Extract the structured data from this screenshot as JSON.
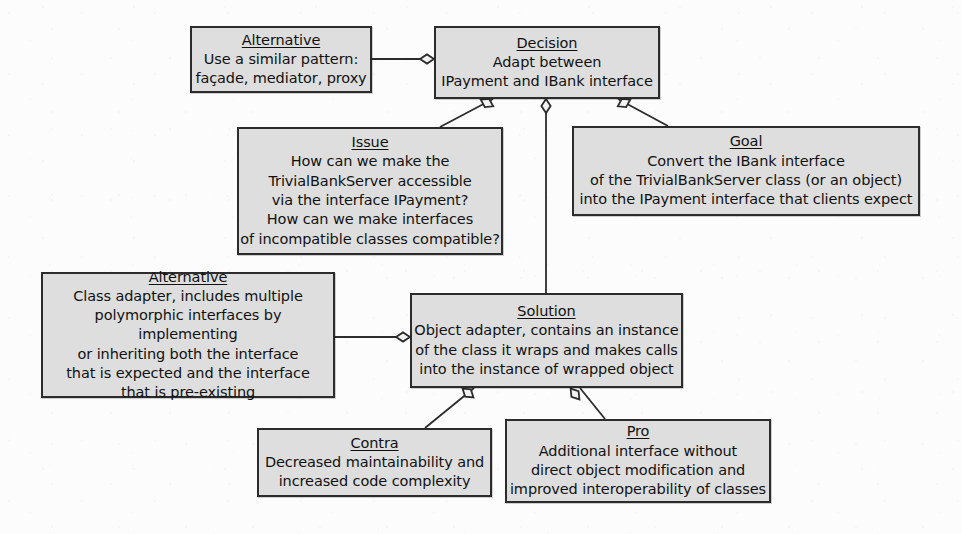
{
  "diagram": {
    "kind": "design-rationale-qoc-diagram",
    "background_color": "#fcfcfc",
    "node_fill_color": "#dedede",
    "node_border_color": "#2c2c2c",
    "text_color": "#111111",
    "nodes": [
      {
        "id": "alternative-pattern",
        "title": "Alternative",
        "body": "Use a similar pattern:\nfaçade, mediator, proxy",
        "x": 190,
        "y": 26,
        "w": 182,
        "h": 67
      },
      {
        "id": "decision",
        "title": "Decision",
        "body": "Adapt between\nIPayment and IBank interface",
        "x": 434,
        "y": 26,
        "w": 226,
        "h": 73
      },
      {
        "id": "issue",
        "title": "Issue",
        "body": "How can we make the\nTrivialBankServer accessible\nvia the interface IPayment?\nHow can we make interfaces\nof incompatible classes compatible?",
        "x": 237,
        "y": 127,
        "w": 266,
        "h": 128
      },
      {
        "id": "goal",
        "title": "Goal",
        "body": "Convert the IBank interface\nof the TrivialBankServer class (or an object)\ninto the IPayment interface that clients expect",
        "x": 572,
        "y": 126,
        "w": 348,
        "h": 90
      },
      {
        "id": "alternative-class-adapter",
        "title": "Alternative",
        "body": "Class adapter, includes multiple\npolymorphic interfaces by implementing\nor inheriting both the interface\nthat is expected and the interface\nthat is pre-existing",
        "x": 41,
        "y": 272,
        "w": 294,
        "h": 126
      },
      {
        "id": "solution",
        "title": "Solution",
        "body": "Object adapter, contains an instance\nof the class it wraps and makes calls\ninto the instance of wrapped object",
        "x": 410,
        "y": 293,
        "w": 273,
        "h": 95
      },
      {
        "id": "contra",
        "title": "Contra",
        "body": "Decreased maintainability and\nincreased code complexity",
        "x": 257,
        "y": 428,
        "w": 235,
        "h": 69
      },
      {
        "id": "pro",
        "title": "Pro",
        "body": "Additional interface without\ndirect object modification and\nimproved interoperability of classes",
        "x": 505,
        "y": 419,
        "w": 266,
        "h": 84
      }
    ],
    "edges": [
      {
        "id": "edge-alternative-pattern-decision",
        "from": "alternative-pattern",
        "to": "decision",
        "x1": 372,
        "y1": 59,
        "x2": 434,
        "y2": 59,
        "diamond_x": 427,
        "diamond_y": 59,
        "diamond_angle": 0
      },
      {
        "id": "edge-decision-issue",
        "from": "decision",
        "to": "issue",
        "x1": 493,
        "y1": 99,
        "x2": 440,
        "y2": 127,
        "diamond_x": 487,
        "diamond_y": 103,
        "diamond_angle": 208
      },
      {
        "id": "edge-decision-solution",
        "from": "decision",
        "to": "solution",
        "x1": 546,
        "y1": 99,
        "x2": 546,
        "y2": 293,
        "diamond_x": 546,
        "diamond_y": 106,
        "diamond_angle": 90
      },
      {
        "id": "edge-decision-goal",
        "from": "decision",
        "to": "goal",
        "x1": 618,
        "y1": 99,
        "x2": 668,
        "y2": 126,
        "diamond_x": 624,
        "diamond_y": 103,
        "diamond_angle": 332
      },
      {
        "id": "edge-alternative-class-adapter-solution",
        "from": "alternative-class-adapter",
        "to": "solution",
        "x1": 335,
        "y1": 337,
        "x2": 410,
        "y2": 337,
        "diamond_x": 403,
        "diamond_y": 337,
        "diamond_angle": 0
      },
      {
        "id": "edge-solution-contra",
        "from": "solution",
        "to": "contra",
        "x1": 474,
        "y1": 388,
        "x2": 425,
        "y2": 428,
        "diamond_x": 468,
        "diamond_y": 393,
        "diamond_angle": 219
      },
      {
        "id": "edge-solution-pro",
        "from": "solution",
        "to": "pro",
        "x1": 580,
        "y1": 388,
        "x2": 605,
        "y2": 419,
        "diamond_x": 575,
        "diamond_y": 394,
        "diamond_angle": 231
      }
    ]
  }
}
